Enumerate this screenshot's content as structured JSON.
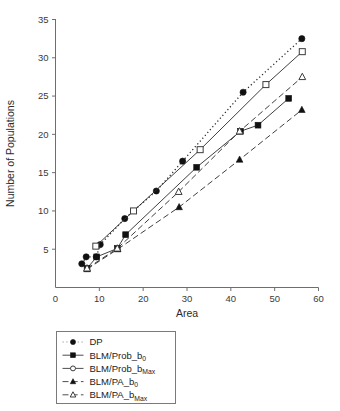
{
  "chart_data": {
    "type": "line",
    "title": "",
    "xlabel": "Area",
    "ylabel": "Number of Populations",
    "xlim": [
      0,
      60
    ],
    "ylim": [
      0,
      35
    ],
    "xticks": [
      0,
      10,
      20,
      30,
      40,
      50,
      60
    ],
    "yticks": [
      5,
      10,
      15,
      20,
      25,
      30,
      35
    ],
    "grid": false,
    "legend_position": "below-plot",
    "series": [
      {
        "name": "DP",
        "marker": "filled-circle",
        "line_style": "dotted",
        "points": [
          [
            6.0,
            3.1
          ],
          [
            7.0,
            4.0
          ],
          [
            9.3,
            4.0
          ],
          [
            10.2,
            5.6
          ],
          [
            15.8,
            9.0
          ],
          [
            23.0,
            12.6
          ],
          [
            29.0,
            16.5
          ],
          [
            42.8,
            25.5
          ],
          [
            56.2,
            32.5
          ]
        ]
      },
      {
        "name": "BLM/Prob_b0",
        "marker": "filled-square",
        "line_style": "solid",
        "points": [
          [
            7.2,
            2.5
          ],
          [
            9.4,
            4.0
          ],
          [
            14.1,
            5.1
          ],
          [
            16.0,
            6.9
          ],
          [
            32.2,
            15.7
          ],
          [
            42.2,
            20.4
          ],
          [
            46.2,
            21.2
          ],
          [
            53.2,
            24.7
          ]
        ]
      },
      {
        "name": "BLM/Prob_bMax",
        "marker": "open-square",
        "line_style": "solid",
        "points": [
          [
            9.2,
            5.4
          ],
          [
            17.8,
            10.0
          ],
          [
            33.0,
            18.0
          ],
          [
            48.0,
            26.5
          ],
          [
            56.3,
            30.8
          ]
        ]
      },
      {
        "name": "BLM/PA_b0",
        "marker": "filled-triangle",
        "line_style": "dashed",
        "points": [
          [
            7.2,
            2.4
          ],
          [
            14.2,
            5.0
          ],
          [
            28.2,
            10.5
          ],
          [
            42.0,
            16.7
          ],
          [
            56.2,
            23.2
          ]
        ]
      },
      {
        "name": "BLM/PA_bMax",
        "marker": "open-triangle",
        "line_style": "dashed",
        "points": [
          [
            7.2,
            2.5
          ],
          [
            14.1,
            5.1
          ],
          [
            28.1,
            12.5
          ],
          [
            42.0,
            20.4
          ],
          [
            56.3,
            27.5
          ]
        ]
      }
    ]
  },
  "axes": {
    "y_title": "Number of Populations",
    "x_title": "Area",
    "x_tick_labels": [
      "0",
      "10",
      "20",
      "30",
      "40",
      "50",
      "60"
    ],
    "y_tick_labels": [
      "5",
      "10",
      "15",
      "20",
      "25",
      "30",
      "35"
    ]
  },
  "legend": {
    "entries": [
      {
        "label": "DP",
        "marker": "filled-circle",
        "line_style": "dotted",
        "sub": ""
      },
      {
        "label": "BLM/Prob_b",
        "marker": "filled-square",
        "line_style": "solid",
        "sub": "0"
      },
      {
        "label": "BLM/Prob_b",
        "marker": "open-circle",
        "line_style": "solid",
        "sub": "Max"
      },
      {
        "label": "BLM/PA_b",
        "marker": "filled-triangle",
        "line_style": "dashed",
        "sub": "0"
      },
      {
        "label": "BLM/PA_b",
        "marker": "open-triangle",
        "line_style": "dashed",
        "sub": "Max"
      }
    ]
  },
  "colors": {
    "axis": "#6e6e6e",
    "marker_fill": "#111111",
    "marker_open": "#ffffff",
    "line": "#2a2a2a",
    "background": "#ffffff"
  }
}
